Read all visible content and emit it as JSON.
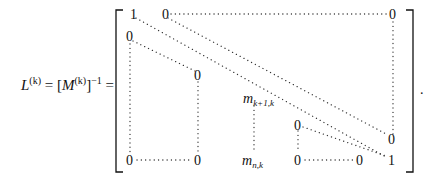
{
  "equation": {
    "lhs": {
      "L": "L",
      "L_sup": "(k)",
      "eq1": " = [",
      "M": "M",
      "M_sup": "(k)",
      "close": "]",
      "inv_sup": "−1",
      "eq2": " ="
    },
    "matrix": {
      "entries": {
        "r1c1": "1",
        "r1c2": "0",
        "r1cn": "0",
        "r2c1": "0",
        "mid_top_zero": "0",
        "mid_bottom_zero": "0",
        "bottom_left_zero": "0",
        "m_top": "m",
        "m_top_sub": "k+1,k",
        "m_bottom": "m",
        "m_bottom_sub": "n,k",
        "right_mid_zero": "0",
        "right_bottom_zero": "0",
        "diag_zero": "0",
        "last_col_zero": "0",
        "last_one": "1"
      }
    },
    "trailing_punct": "."
  }
}
